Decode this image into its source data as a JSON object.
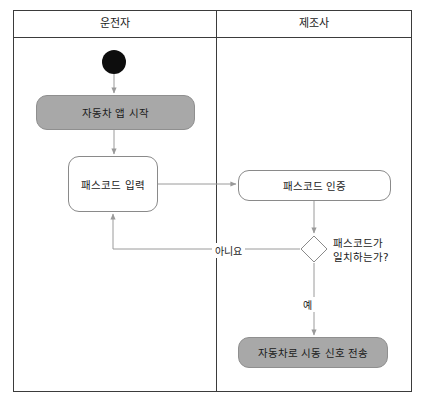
{
  "diagram": {
    "type": "uml-activity-diagram",
    "lanes": [
      {
        "id": "driver",
        "title": "운전자"
      },
      {
        "id": "manufacturer",
        "title": "제조사"
      }
    ],
    "nodes": {
      "start": {
        "kind": "initial-node",
        "lane": "driver"
      },
      "app_start": {
        "kind": "action",
        "lane": "driver",
        "label": "자동차 앱 시작",
        "style": "filled"
      },
      "passcode_input": {
        "kind": "action",
        "lane": "driver",
        "label": "패스코드 입력",
        "style": "plain"
      },
      "passcode_auth": {
        "kind": "action",
        "lane": "manufacturer",
        "label": "패스코드 인증",
        "style": "plain"
      },
      "decision": {
        "kind": "decision",
        "lane": "manufacturer",
        "label_line1": "패스코드가",
        "label_line2": "일치하는가?"
      },
      "send_signal": {
        "kind": "action",
        "lane": "manufacturer",
        "label": "자동차로 시동 신호 전송",
        "style": "filled"
      }
    },
    "edges": {
      "no_label": "아니요",
      "yes_label": "예"
    },
    "colors": {
      "filled_node": "#a8a8a8",
      "node_border": "#8a8a8a",
      "frame_border": "#3b3b3b",
      "edge": "#9a9a9a",
      "start_node": "#0d0d0d",
      "text": "#1a1a1a"
    }
  }
}
